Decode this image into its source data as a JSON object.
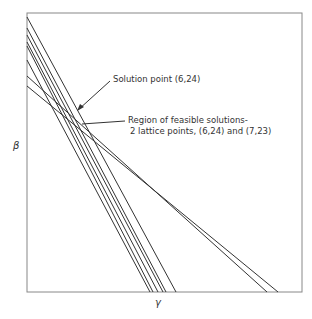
{
  "figure": {
    "x_axis_label": "γ",
    "y_axis_label": "β",
    "annotations": {
      "solution_point": "Solution point (6,24)",
      "region_line1": "Region of feasible solutions-",
      "region_line2": "2 lattice points, (6,24) and (7,23)"
    },
    "line_color": "#333333"
  }
}
